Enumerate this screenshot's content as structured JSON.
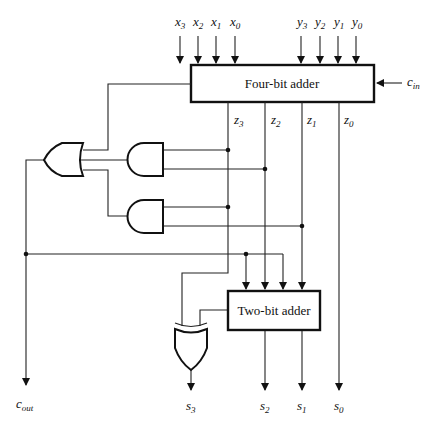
{
  "diagram": {
    "blocks": {
      "four_bit_adder": {
        "label": "Four-bit adder"
      },
      "two_bit_adder": {
        "label": "Two-bit adder"
      }
    },
    "inputs": {
      "x": [
        {
          "base": "x",
          "sub": "3"
        },
        {
          "base": "x",
          "sub": "2"
        },
        {
          "base": "x",
          "sub": "1"
        },
        {
          "base": "x",
          "sub": "0"
        }
      ],
      "y": [
        {
          "base": "y",
          "sub": "3"
        },
        {
          "base": "y",
          "sub": "2"
        },
        {
          "base": "y",
          "sub": "1"
        },
        {
          "base": "y",
          "sub": "0"
        }
      ],
      "cin": {
        "base": "c",
        "sub": "in"
      }
    },
    "intermediate": [
      {
        "base": "z",
        "sub": "3"
      },
      {
        "base": "z",
        "sub": "2"
      },
      {
        "base": "z",
        "sub": "1"
      },
      {
        "base": "z",
        "sub": "0"
      }
    ],
    "outputs": {
      "cout": {
        "base": "c",
        "sub": "out"
      },
      "s": [
        {
          "base": "s",
          "sub": "3"
        },
        {
          "base": "s",
          "sub": "2"
        },
        {
          "base": "s",
          "sub": "1"
        },
        {
          "base": "s",
          "sub": "0"
        }
      ]
    },
    "gates": [
      "OR",
      "AND",
      "AND",
      "XOR"
    ],
    "colors": {
      "ink": "#111111",
      "background": "#ffffff"
    }
  }
}
